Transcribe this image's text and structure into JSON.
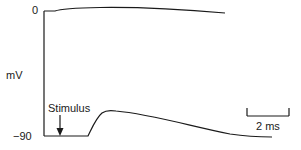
{
  "figure": {
    "y_axis": {
      "unit_label": "mV",
      "top_tick_label": "0",
      "bottom_tick_label": "−90"
    },
    "annotation": {
      "stimulus_label": "Stimulus",
      "stimulus_marker": "down-arrow"
    },
    "scale_bar": {
      "label": "2 ms"
    },
    "traces": [
      {
        "name": "reference-trace-0mV",
        "description": "near 0 mV line, slight rise then gentle downward drift"
      },
      {
        "name": "membrane-potential-trace",
        "description": "resting at -90 mV, subthreshold depolarization after stimulus, then slow decay toward baseline"
      }
    ],
    "colors": {
      "line": "#1a1a1a",
      "background": "#ffffff"
    }
  }
}
